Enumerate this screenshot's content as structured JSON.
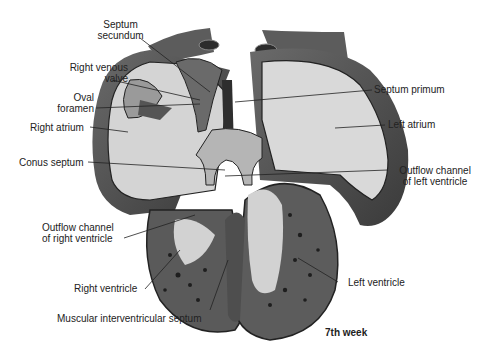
{
  "figure": {
    "caption": "7th week",
    "colors": {
      "wall": "#5a5a5a",
      "wall_dark": "#2e2e2e",
      "chamber": "#d6d6d6",
      "chamber_light": "#e8e8e8",
      "septum": "#8c8c8c",
      "leader": "#222222",
      "text": "#222222"
    }
  },
  "labels": {
    "septum_secundum": [
      "Septum",
      "secundum"
    ],
    "right_venous_valve": [
      "Right venous",
      "valve"
    ],
    "oval_foramen": [
      "Oval",
      "foramen"
    ],
    "right_atrium": "Right atrium",
    "conus_septum": "Conus septum",
    "outflow_rv": [
      "Outflow channel",
      "of right ventricle"
    ],
    "right_ventricle": "Right ventricle",
    "muscular_iv_septum": "Muscular interventricular septum",
    "septum_primum": "Septum primum",
    "left_atrium": "Left atrium",
    "outflow_lv": [
      "Outflow channel",
      "of left ventricle"
    ],
    "left_ventricle": "Left ventricle"
  }
}
